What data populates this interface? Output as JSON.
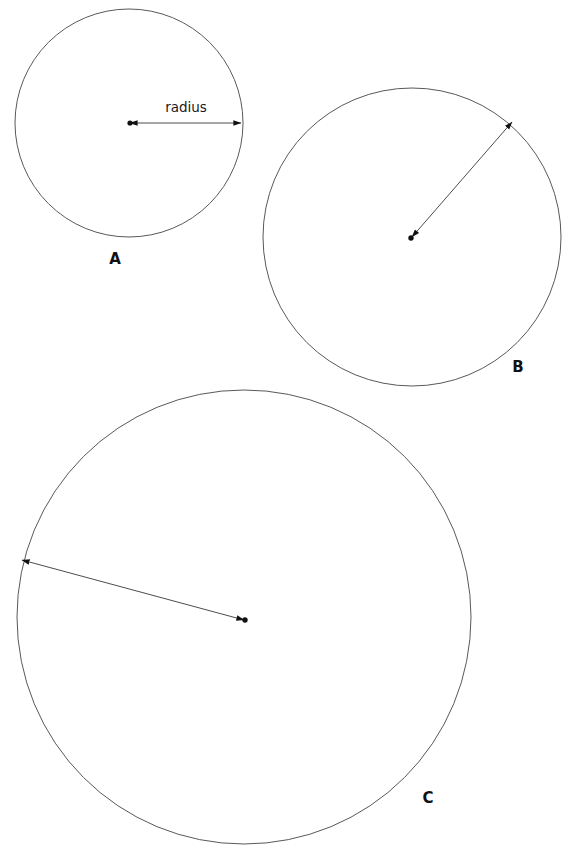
{
  "figure": {
    "background_color": "#ffffff",
    "stroke_color": "#595959",
    "ink_color": "#111111",
    "canvas": {
      "width": 565,
      "height": 864
    },
    "annotation_label": "radius",
    "circles": [
      {
        "id": "A",
        "label": "A",
        "center": {
          "x": 129,
          "y": 123
        },
        "radius": 114,
        "label_pos": {
          "x": 115,
          "y": 264
        },
        "radius_arrow": {
          "from": {
            "x": 130,
            "y": 123
          },
          "to": {
            "x": 241,
            "y": 123
          },
          "double_headed": true,
          "label": "radius",
          "label_pos": {
            "x": 186,
            "y": 112
          }
        }
      },
      {
        "id": "B",
        "label": "B",
        "center": {
          "x": 412,
          "y": 237
        },
        "radius": 149,
        "label_pos": {
          "x": 518,
          "y": 372
        },
        "radius_arrow": {
          "from": {
            "x": 412,
            "y": 237
          },
          "to": {
            "x": 512,
            "y": 122
          },
          "double_headed": true,
          "label": "",
          "label_pos": null
        }
      },
      {
        "id": "C",
        "label": "C",
        "center": {
          "x": 244,
          "y": 617
        },
        "radius": 227,
        "label_pos": {
          "x": 428,
          "y": 803
        },
        "radius_arrow": {
          "from": {
            "x": 244,
            "y": 620
          },
          "to": {
            "x": 22,
            "y": 560
          },
          "double_headed": true,
          "label": "",
          "label_pos": null
        }
      }
    ]
  }
}
